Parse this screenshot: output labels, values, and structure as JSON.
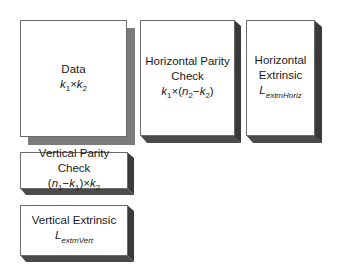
{
  "diagram": {
    "type": "block-structure",
    "colors": {
      "border": "#6a6a6a",
      "flat_shadow": "#7b7b7b",
      "extrusion_side": "#3a3a3a",
      "extrusion_bottom": "#4a4a4a",
      "fill": "#ffffff"
    },
    "blocks": [
      {
        "id": "data",
        "title": "Data",
        "formula": {
          "a": "k",
          "a_sub": "1",
          "op": "×",
          "b": "k",
          "b_sub": "2"
        }
      },
      {
        "id": "horizontal_parity",
        "title_line1": "Horizontal Parity",
        "title_line2": "Check",
        "formula": {
          "a": "k",
          "a_sub": "1",
          "op": "×",
          "open": "(",
          "b": "n",
          "b_sub": "2",
          "minus": "−",
          "c": "k",
          "c_sub": "2",
          "close": ")"
        }
      },
      {
        "id": "horizontal_extrinsic",
        "title_line1": "Horizontal",
        "title_line2": "Extrinsic",
        "symbol": {
          "base": "L",
          "sub": "extmHoriz"
        }
      },
      {
        "id": "vertical_parity",
        "title": "Vertical Parity Check",
        "formula": {
          "open": "(",
          "a": "n",
          "a_sub": "1",
          "minus": "−",
          "b": "k",
          "b_sub": "1",
          "close": ")",
          "op": "×",
          "c": "k",
          "c_sub": "2"
        }
      },
      {
        "id": "vertical_extrinsic",
        "title": "Vertical Extrinsic",
        "symbol": {
          "base": "L",
          "sub": "extmVert"
        }
      }
    ]
  }
}
